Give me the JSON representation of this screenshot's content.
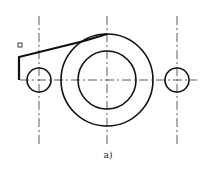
{
  "diagram": {
    "caption": "a)",
    "colors": {
      "line": "#111111",
      "centerline": "#333333",
      "background": "#ffffff"
    },
    "centerlines": {
      "horizontal": {
        "y": 80,
        "x1": 20,
        "x2": 197
      },
      "verticals": [
        {
          "x": 39,
          "y1": 16,
          "y2": 146
        },
        {
          "x": 107,
          "y1": 16,
          "y2": 146
        },
        {
          "x": 177,
          "y1": 16,
          "y2": 146
        }
      ]
    },
    "circles": [
      {
        "name": "outer-boss",
        "cx": 107,
        "cy": 80,
        "r": 46
      },
      {
        "name": "inner-bore",
        "cx": 107,
        "cy": 80,
        "r": 29
      },
      {
        "name": "left-hole",
        "cx": 39,
        "cy": 80,
        "r": 12
      },
      {
        "name": "right-hole",
        "cx": 177,
        "cy": 80,
        "r": 12
      }
    ],
    "marker": {
      "x": 18,
      "y": 43,
      "size": 4
    }
  }
}
